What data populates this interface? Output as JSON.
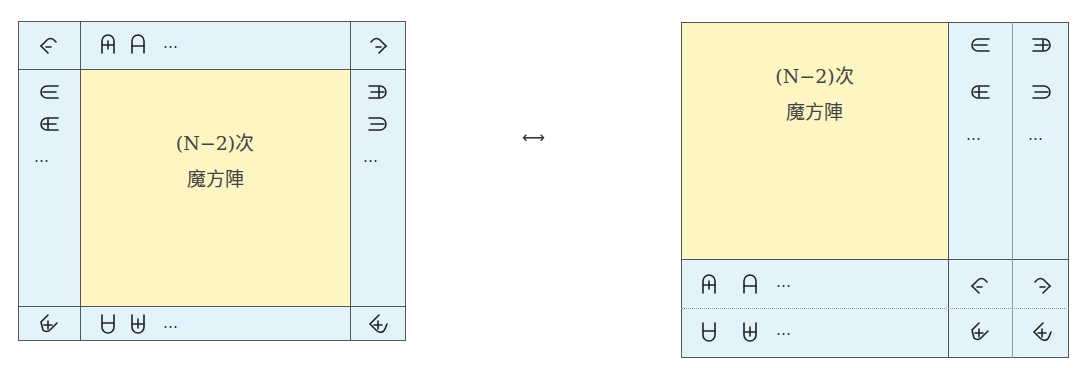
{
  "colors": {
    "border_region": "#e3f3fb",
    "inner_square": "#fdf6c3",
    "grid_line": "#555555"
  },
  "left_diagram": {
    "inner_label_line1": "(N−2)次",
    "inner_label_line2": "魔方陣",
    "top_row": {
      "corner_left": "arch-minus-left-icon",
      "cells": [
        "arch-plus-icon",
        "arch-minus-icon"
      ],
      "ellipsis": "…",
      "corner_right": "arch-minus-right-icon"
    },
    "left_column": {
      "cells": [
        "open-right-minus-icon",
        "open-right-plus-icon"
      ],
      "ellipsis": "…"
    },
    "right_column": {
      "cells": [
        "open-left-plus-icon",
        "open-left-minus-icon"
      ],
      "ellipsis": "…"
    },
    "bottom_row": {
      "corner_left": "cup-plus-left-icon",
      "cells": [
        "cup-minus-icon",
        "cup-plus-icon"
      ],
      "ellipsis": "…",
      "corner_right": "cup-plus-right-icon"
    }
  },
  "arrow": "⟷",
  "right_diagram": {
    "inner_label_line1": "(N−2)次",
    "inner_label_line2": "魔方陣",
    "column_a": {
      "cells": [
        "open-right-minus-icon",
        "open-right-plus-icon"
      ],
      "ellipsis": "…"
    },
    "column_b": {
      "cells": [
        "open-left-plus-icon",
        "open-left-minus-icon"
      ],
      "ellipsis": "…"
    },
    "row_a": {
      "cells": [
        "arch-plus-icon",
        "arch-minus-icon"
      ],
      "ellipsis": "…",
      "corners": [
        "arch-minus-left-icon",
        "arch-minus-right-icon"
      ]
    },
    "row_b": {
      "cells": [
        "cup-minus-icon",
        "cup-plus-icon"
      ],
      "ellipsis": "…",
      "corners": [
        "cup-plus-left-icon",
        "cup-plus-right-icon"
      ]
    }
  }
}
